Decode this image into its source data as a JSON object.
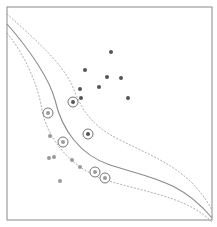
{
  "figure": {
    "title": "",
    "colors": {
      "frame": "#8a8a8a",
      "boundary": "#8c8c8c",
      "margin": "#9a9a9a",
      "class_dark": "#555555",
      "class_light": "#9a9a9a",
      "support_ring": "#666666"
    }
  },
  "boundary": {
    "decision": "M7,24 C30,50 50,80 55,100 C62,130 80,155 110,165 C150,178 180,180 212,218",
    "margin_upper": "M7,14 C30,35 60,60 72,85 C82,110 90,125 120,140 C160,160 190,170 212,210",
    "margin_lower": "M7,33 C25,55 38,85 42,110 C48,140 70,165 100,178 C140,192 185,195 212,222"
  },
  "points": {
    "dark": [
      {
        "x": 111,
        "y": 52,
        "sv": false
      },
      {
        "x": 85,
        "y": 70,
        "sv": false
      },
      {
        "x": 107,
        "y": 77,
        "sv": false
      },
      {
        "x": 121,
        "y": 78,
        "sv": false
      },
      {
        "x": 80,
        "y": 89,
        "sv": false
      },
      {
        "x": 99,
        "y": 87,
        "sv": false
      },
      {
        "x": 81,
        "y": 98,
        "sv": false
      },
      {
        "x": 128,
        "y": 98,
        "sv": false
      },
      {
        "x": 73,
        "y": 102,
        "sv": true
      },
      {
        "x": 88,
        "y": 134,
        "sv": true
      }
    ],
    "light": [
      {
        "x": 48,
        "y": 113,
        "sv": true
      },
      {
        "x": 50,
        "y": 136,
        "sv": false
      },
      {
        "x": 63,
        "y": 142,
        "sv": true
      },
      {
        "x": 49,
        "y": 158,
        "sv": false
      },
      {
        "x": 54,
        "y": 157,
        "sv": false
      },
      {
        "x": 72,
        "y": 160,
        "sv": false
      },
      {
        "x": 80,
        "y": 167,
        "sv": false
      },
      {
        "x": 60,
        "y": 181,
        "sv": false
      },
      {
        "x": 95,
        "y": 172,
        "sv": true
      },
      {
        "x": 105,
        "y": 178,
        "sv": true
      }
    ]
  }
}
